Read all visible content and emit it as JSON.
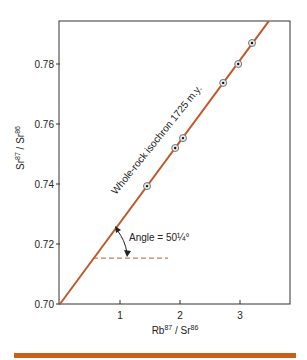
{
  "chart_data": {
    "type": "scatter",
    "title": "",
    "xlabel": "Rb87 / Sr86",
    "xlabel_parts": {
      "base1": "Rb",
      "sup1": "87",
      "sep": " / Sr",
      "sup2": "86"
    },
    "ylabel": "Sr87 / Sr86",
    "ylabel_parts": {
      "base1": "Sr",
      "sup1": "87",
      "sep": " / Sr",
      "sup2": "86"
    },
    "xlim": [
      0,
      3.85
    ],
    "ylim": [
      0.7,
      0.7943
    ],
    "x_ticks": [
      1,
      2,
      3
    ],
    "x_tick_labels": [
      "1",
      "2",
      "3"
    ],
    "y_ticks": [
      0.7,
      0.72,
      0.74,
      0.76,
      0.78
    ],
    "y_tick_labels": [
      "0.70",
      "0.72",
      "0.74",
      "0.76",
      "0.78"
    ],
    "grid": false,
    "points": [
      {
        "x": 1.45,
        "y": 0.7393
      },
      {
        "x": 1.92,
        "y": 0.752
      },
      {
        "x": 2.05,
        "y": 0.7553
      },
      {
        "x": 2.72,
        "y": 0.7737
      },
      {
        "x": 2.97,
        "y": 0.78
      },
      {
        "x": 3.2,
        "y": 0.787
      }
    ],
    "isochron": {
      "label": "Whole-rock isochron 1725 m.y.",
      "intercept": 0.7,
      "slope": 0.0271,
      "x_range": [
        0,
        3.48
      ]
    },
    "reference_line": {
      "y": 0.7153,
      "x_range": [
        0.55,
        1.8
      ],
      "style": "dashed"
    },
    "angle_annotation": "Angle = 50¼°",
    "colors": {
      "line": "#c0582a",
      "frame": "#333333",
      "bar": "#c8601c"
    }
  }
}
